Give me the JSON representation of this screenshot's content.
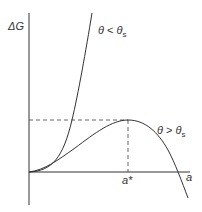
{
  "diagram": {
    "type": "free-energy-vs-size",
    "y_axis_label": "ΔG",
    "x_axis_label": "a",
    "critical_size_label": "a*",
    "curves": [
      {
        "name": "low-theta-curve",
        "label_theta": "θ",
        "label_rel": " < ",
        "label_sub_base": "θ",
        "label_subscript": "s",
        "shape": "monotonic-increasing-steep"
      },
      {
        "name": "high-theta-curve",
        "label_theta": "θ",
        "label_rel": " > ",
        "label_sub_base": "θ",
        "label_subscript": "s",
        "shape": "maximum-then-decreasing"
      }
    ],
    "guides": [
      "dashed horizontal at maximum ΔG",
      "dashed vertical at a*"
    ],
    "colors": {
      "line": "#333333",
      "text": "#333333",
      "background": "#ffffff"
    }
  }
}
